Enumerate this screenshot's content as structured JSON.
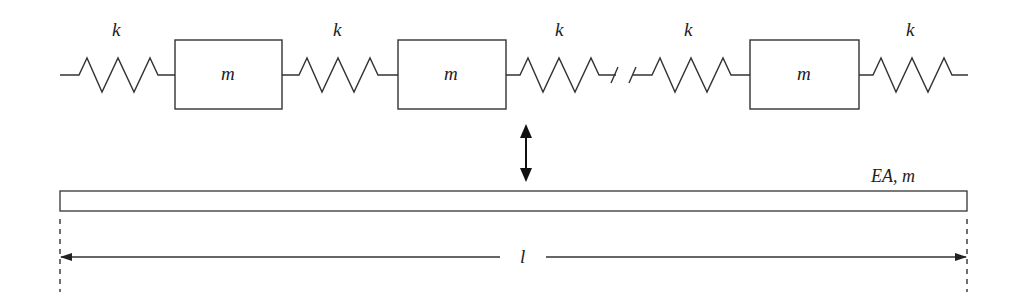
{
  "diagram": {
    "springs": [
      {
        "label": "k",
        "x": 118
      },
      {
        "label": "k",
        "x": 339
      },
      {
        "label": "k",
        "x": 561
      },
      {
        "label": "k",
        "x": 690
      },
      {
        "label": "k",
        "x": 912
      }
    ],
    "masses": [
      {
        "label": "m"
      },
      {
        "label": "m"
      },
      {
        "label": "m"
      }
    ],
    "bar_label": "EA, m",
    "length_label": "l",
    "equivalence_symbol": "double-arrow"
  }
}
